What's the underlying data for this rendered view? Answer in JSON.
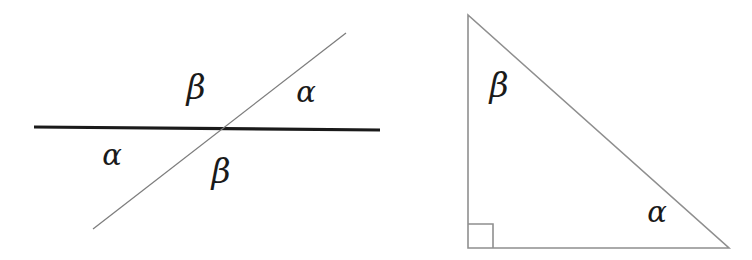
{
  "figure": {
    "type": "geometry-diagram",
    "canvas": {
      "width": 752,
      "height": 260,
      "background": "#ffffff"
    },
    "colors": {
      "thick_line": "#1a1a1a",
      "thin_line": "#8a8a8a",
      "triangle_stroke": "#8f8f8f",
      "label_text": "#1a1a1a"
    },
    "panels": [
      {
        "id": "intersecting-lines",
        "name": "intersecting-lines-diagram",
        "shapes": [
          {
            "id": "horizontal-line",
            "name": "horizontal-line",
            "kind": "line",
            "x1": 34,
            "y1": 127,
            "x2": 380,
            "y2": 130,
            "stroke": "#1a1a1a",
            "stroke_width": 3.2
          },
          {
            "id": "transversal-line",
            "name": "transversal-line",
            "kind": "line",
            "x1": 93,
            "y1": 229,
            "x2": 346,
            "y2": 33,
            "stroke": "#7d7d7d",
            "stroke_width": 1.3
          }
        ],
        "intersection": {
          "x": 218,
          "y": 129
        },
        "labels": [
          {
            "id": "beta-top",
            "name": "angle-label-beta-top",
            "text": "β",
            "symbol": "beta",
            "x": 196,
            "y": 87,
            "position": "above-left-of-intersection"
          },
          {
            "id": "alpha-top",
            "name": "angle-label-alpha-top-right",
            "text": "α",
            "symbol": "alpha",
            "x": 306,
            "y": 92,
            "position": "above-right-of-intersection"
          },
          {
            "id": "alpha-bottom",
            "name": "angle-label-alpha-bottom-left",
            "text": "α",
            "symbol": "alpha",
            "x": 112,
            "y": 155,
            "position": "below-left-of-intersection"
          },
          {
            "id": "beta-bottom",
            "name": "angle-label-beta-bottom",
            "text": "β",
            "symbol": "beta",
            "x": 221,
            "y": 171,
            "position": "below-right-of-intersection"
          }
        ]
      },
      {
        "id": "right-triangle",
        "name": "right-triangle-diagram",
        "shapes": [
          {
            "id": "triangle-outline",
            "name": "triangle-outline",
            "kind": "polygon",
            "points": "468,15 468,248 729,248",
            "stroke": "#8f8f8f",
            "stroke_width": 1.6,
            "fill": "none"
          },
          {
            "id": "right-angle-marker",
            "name": "right-angle-marker",
            "kind": "polyline",
            "points": "468,224 493,224 493,248",
            "stroke": "#8f8f8f",
            "stroke_width": 1.6,
            "fill": "none"
          }
        ],
        "vertices": {
          "top": {
            "x": 468,
            "y": 15
          },
          "bottom_left": {
            "x": 468,
            "y": 248
          },
          "bottom_right": {
            "x": 729,
            "y": 248
          }
        },
        "labels": [
          {
            "id": "beta-apex",
            "name": "angle-label-beta-apex",
            "text": "β",
            "symbol": "beta",
            "x": 499,
            "y": 85,
            "position": "at-top-vertex"
          },
          {
            "id": "alpha-base",
            "name": "angle-label-alpha-base-right",
            "text": "α",
            "symbol": "alpha",
            "x": 657,
            "y": 212,
            "position": "at-bottom-right-vertex"
          }
        ]
      }
    ]
  }
}
